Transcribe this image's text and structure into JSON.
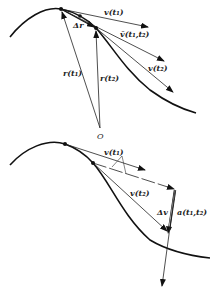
{
  "figure": {
    "top": {
      "labels": {
        "v_t1": "v(t₁)",
        "vbar": "v̄(t₁,t₂)",
        "v_t2": "v(t₂)",
        "delta_r": "Δr",
        "r_t1": "r(t₁)",
        "r_t2": "r(t₂)",
        "origin": "O"
      }
    },
    "bottom": {
      "labels": {
        "v_t1": "v(t₁)",
        "v_t2": "v(t₂)",
        "delta_v": "Δv",
        "a": "a(t₁,t₂)"
      }
    }
  },
  "colors": {
    "ink": "#111111",
    "background": "#ffffff"
  }
}
